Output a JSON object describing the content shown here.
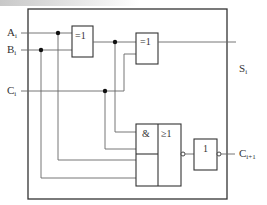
{
  "diagram": {
    "title": "",
    "type": "full-adder logic circuit",
    "inputs": [
      {
        "name": "A",
        "sub": "i"
      },
      {
        "name": "B",
        "sub": "i"
      },
      {
        "name": "C",
        "sub": "i"
      }
    ],
    "outputs": [
      {
        "name": "S",
        "sub": "i"
      },
      {
        "name": "C",
        "sub": "i+1"
      }
    ],
    "gates": {
      "xor1": {
        "symbol": "=1"
      },
      "xor2": {
        "symbol": "=1"
      },
      "aoi_and": {
        "symbol": "&"
      },
      "aoi_or": {
        "symbol": "≥1"
      },
      "not": {
        "symbol": "1"
      }
    },
    "colors": {
      "stroke": "#333333",
      "wire": "#666666",
      "background": "#ffffff"
    }
  }
}
